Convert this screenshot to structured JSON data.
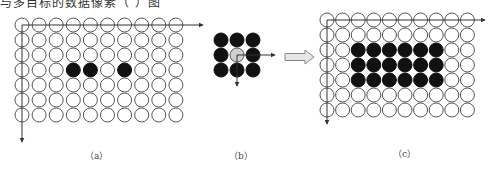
{
  "top_caption": "与多目标的数据像素（   ）图",
  "colors": {
    "stroke": "#555555",
    "filled": "#111111",
    "empty": "#ffffff",
    "center_highlight": "#d0d0d0",
    "block_arrow_fill": "#e6e6e6",
    "block_arrow_stroke": "#888888"
  },
  "panels": [
    {
      "id": "a",
      "label": "（a）",
      "label_pos": [
        85,
        149
      ],
      "grid": {
        "cols": 10,
        "rows": 7,
        "origin": [
          22,
          25
        ],
        "dx": 17.1,
        "dy": 15,
        "r": 7,
        "filled": [
          [
            3,
            3
          ],
          [
            3,
            4
          ],
          [
            3,
            6
          ]
        ]
      },
      "axes": {
        "x_end": 203,
        "y_end": 142
      }
    },
    {
      "id": "b",
      "label": "（b）",
      "label_pos": [
        229,
        149
      ],
      "kernel": {
        "cols": 3,
        "rows": 3,
        "origin": [
          221,
          40
        ],
        "dx": 16,
        "dy": 15,
        "r": 7,
        "center": [
          1,
          1
        ]
      },
      "axes": {
        "x_end": 275,
        "y_end": 86
      }
    },
    {
      "id": "c",
      "label": "（c）",
      "label_pos": [
        393,
        147
      ],
      "grid": {
        "cols": 10,
        "rows": 7,
        "origin": [
          327,
          20
        ],
        "dx": 15.6,
        "dy": 15,
        "r": 7,
        "filled": [
          [
            2,
            2
          ],
          [
            2,
            3
          ],
          [
            2,
            4
          ],
          [
            2,
            5
          ],
          [
            2,
            6
          ],
          [
            2,
            7
          ],
          [
            3,
            2
          ],
          [
            3,
            3
          ],
          [
            3,
            4
          ],
          [
            3,
            5
          ],
          [
            3,
            6
          ],
          [
            3,
            7
          ],
          [
            4,
            2
          ],
          [
            4,
            3
          ],
          [
            4,
            4
          ],
          [
            4,
            5
          ],
          [
            4,
            6
          ],
          [
            4,
            7
          ]
        ]
      },
      "axes": {
        "x_end": 485,
        "y_end": 124
      }
    }
  ],
  "transform_arrow": {
    "x1": 285,
    "x2": 314,
    "y": 57,
    "shaft_h": 7,
    "head_h": 14,
    "head_w": 9
  }
}
